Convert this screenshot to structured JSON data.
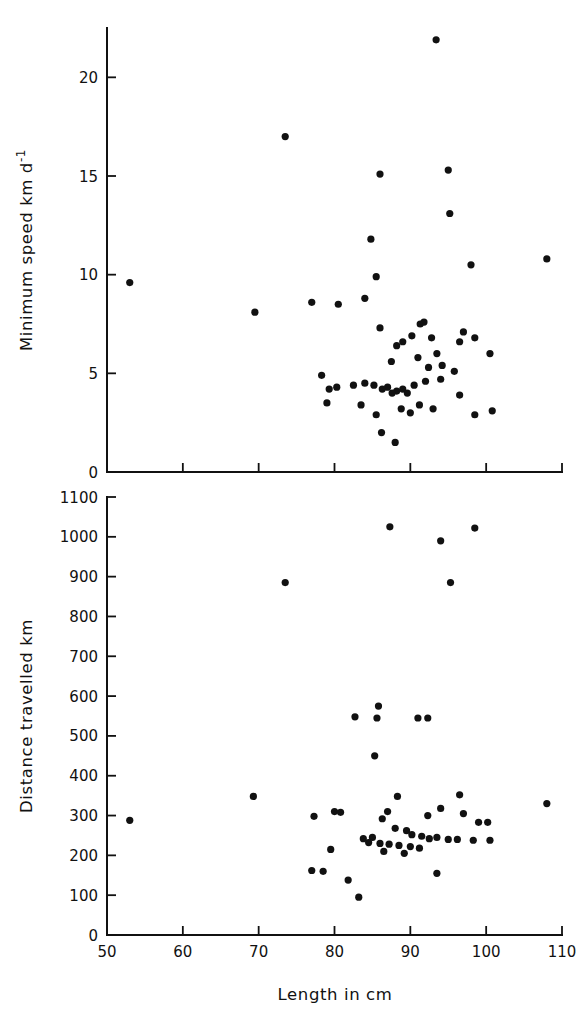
{
  "figure": {
    "background": "#ffffff",
    "ink_color": "#111111",
    "marker_color": "#111111"
  },
  "xaxis": {
    "label": "Length in cm",
    "ticks": [
      50,
      60,
      70,
      80,
      90,
      100,
      110
    ],
    "tick_labels": [
      "50",
      "60",
      "70",
      "80",
      "90",
      "100",
      "110"
    ],
    "min": 50,
    "max": 110
  },
  "chart_data": [
    {
      "type": "scatter",
      "title": "",
      "xlabel": "Length in cm",
      "ylabel": "Minimum speed km d-1",
      "ylabel_display": "Minimum speed km d",
      "ylabel_exponent": "-1",
      "xlim": [
        50,
        110
      ],
      "ylim": [
        0,
        22.5
      ],
      "grid": false,
      "legend": "none",
      "yticks": [
        0,
        5,
        10,
        15,
        20
      ],
      "ytick_labels": [
        "0",
        "5",
        "10",
        "15",
        "20"
      ],
      "xticks": [
        50,
        60,
        70,
        80,
        90,
        100,
        110
      ],
      "xtick_labels": [
        "50",
        "60",
        "70",
        "80",
        "90",
        "100",
        "110"
      ],
      "points": [
        [
          53.0,
          9.6
        ],
        [
          73.5,
          17.0
        ],
        [
          69.5,
          8.1
        ],
        [
          77.0,
          8.6
        ],
        [
          80.5,
          8.5
        ],
        [
          84.0,
          8.8
        ],
        [
          85.5,
          9.9
        ],
        [
          86.0,
          15.1
        ],
        [
          93.4,
          21.9
        ],
        [
          95.0,
          15.3
        ],
        [
          95.2,
          13.1
        ],
        [
          98.0,
          10.5
        ],
        [
          108.0,
          10.8
        ],
        [
          84.8,
          11.8
        ],
        [
          86.0,
          7.3
        ],
        [
          87.5,
          5.6
        ],
        [
          88.2,
          6.4
        ],
        [
          89.0,
          6.6
        ],
        [
          90.2,
          6.9
        ],
        [
          91.3,
          7.5
        ],
        [
          91.8,
          7.6
        ],
        [
          92.8,
          6.8
        ],
        [
          93.5,
          6.0
        ],
        [
          96.5,
          6.6
        ],
        [
          97.0,
          7.1
        ],
        [
          98.5,
          6.8
        ],
        [
          100.5,
          6.0
        ],
        [
          95.8,
          5.1
        ],
        [
          94.0,
          4.7
        ],
        [
          92.0,
          4.6
        ],
        [
          90.5,
          4.4
        ],
        [
          89.0,
          4.2
        ],
        [
          88.2,
          4.1
        ],
        [
          87.6,
          4.0
        ],
        [
          87.0,
          4.3
        ],
        [
          86.3,
          4.2
        ],
        [
          85.2,
          4.4
        ],
        [
          84.0,
          4.5
        ],
        [
          82.5,
          4.4
        ],
        [
          78.3,
          4.9
        ],
        [
          79.3,
          4.2
        ],
        [
          80.3,
          4.3
        ],
        [
          79.0,
          3.5
        ],
        [
          83.5,
          3.4
        ],
        [
          85.5,
          2.9
        ],
        [
          88.8,
          3.2
        ],
        [
          90.0,
          3.0
        ],
        [
          91.2,
          3.4
        ],
        [
          93.0,
          3.2
        ],
        [
          96.5,
          3.9
        ],
        [
          98.5,
          2.9
        ],
        [
          100.8,
          3.1
        ],
        [
          86.2,
          2.0
        ],
        [
          88.0,
          1.5
        ],
        [
          89.6,
          4.0
        ],
        [
          92.4,
          5.3
        ],
        [
          94.2,
          5.4
        ],
        [
          91.0,
          5.8
        ]
      ]
    },
    {
      "type": "scatter",
      "title": "",
      "xlabel": "Length in cm",
      "ylabel": "Distance travelled km",
      "xlim": [
        50,
        110
      ],
      "ylim": [
        0,
        1100
      ],
      "grid": false,
      "legend": "none",
      "yticks": [
        0,
        100,
        200,
        300,
        400,
        500,
        600,
        700,
        800,
        900,
        1000,
        1100
      ],
      "ytick_labels": [
        "0",
        "100",
        "200",
        "300",
        "400",
        "500",
        "600",
        "700",
        "800",
        "900",
        "1000",
        "1100"
      ],
      "xticks": [
        50,
        60,
        70,
        80,
        90,
        100,
        110
      ],
      "xtick_labels": [
        "50",
        "60",
        "70",
        "80",
        "90",
        "100",
        "110"
      ],
      "points": [
        [
          53.0,
          288
        ],
        [
          73.5,
          885
        ],
        [
          87.3,
          1025
        ],
        [
          98.5,
          1022
        ],
        [
          94.0,
          990
        ],
        [
          95.3,
          885
        ],
        [
          85.8,
          575
        ],
        [
          85.6,
          545
        ],
        [
          82.7,
          548
        ],
        [
          91.0,
          545
        ],
        [
          92.3,
          545
        ],
        [
          85.3,
          450
        ],
        [
          69.3,
          348
        ],
        [
          108.0,
          330
        ],
        [
          88.3,
          348
        ],
        [
          96.5,
          352
        ],
        [
          94.0,
          318
        ],
        [
          92.3,
          300
        ],
        [
          97.0,
          305
        ],
        [
          99.0,
          283
        ],
        [
          100.2,
          283
        ],
        [
          87.0,
          310
        ],
        [
          86.3,
          292
        ],
        [
          88.0,
          268
        ],
        [
          89.5,
          262
        ],
        [
          90.2,
          252
        ],
        [
          91.5,
          248
        ],
        [
          92.5,
          242
        ],
        [
          93.5,
          245
        ],
        [
          95.0,
          240
        ],
        [
          96.2,
          240
        ],
        [
          98.3,
          238
        ],
        [
          100.5,
          238
        ],
        [
          85.0,
          245
        ],
        [
          83.8,
          242
        ],
        [
          84.5,
          232
        ],
        [
          86.0,
          230
        ],
        [
          87.2,
          228
        ],
        [
          88.5,
          225
        ],
        [
          90.0,
          222
        ],
        [
          91.2,
          218
        ],
        [
          86.5,
          210
        ],
        [
          89.2,
          205
        ],
        [
          93.5,
          155
        ],
        [
          79.5,
          215
        ],
        [
          77.0,
          162
        ],
        [
          78.5,
          160
        ],
        [
          81.8,
          138
        ],
        [
          83.2,
          95
        ],
        [
          77.3,
          298
        ],
        [
          80.0,
          310
        ],
        [
          80.8,
          308
        ]
      ]
    }
  ]
}
